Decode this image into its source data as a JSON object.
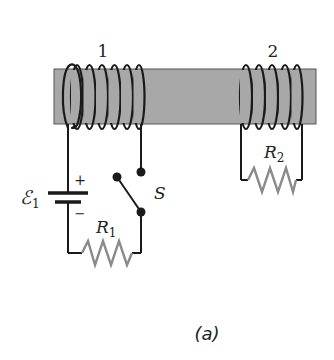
{
  "diagram": {
    "coil_labels": {
      "coil1": "1",
      "coil2": "2"
    },
    "emf": {
      "symbol": "ℰ",
      "subscript": "1",
      "plus": "+",
      "minus": "−"
    },
    "switch_label": "S",
    "resistor1": {
      "symbol": "R",
      "subscript": "1"
    },
    "resistor2": {
      "symbol": "R",
      "subscript": "2"
    },
    "caption": "(a)",
    "colors": {
      "core": "#a8a8a8",
      "core_border": "#555555",
      "wire": "#1a1a1a",
      "resistor": "#8a8a8a",
      "background": "#ffffff"
    }
  }
}
